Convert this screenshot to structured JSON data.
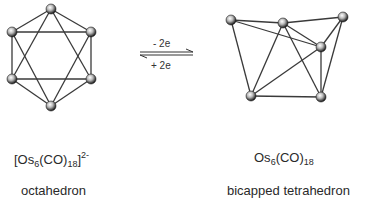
{
  "left_structure": {
    "formula_prefix": "[Os",
    "formula_sub1": "6",
    "formula_mid": "(CO)",
    "formula_sub2": "18",
    "formula_close": "]",
    "formula_charge": "2-",
    "geometry": "octahedron"
  },
  "right_structure": {
    "formula_prefix": "Os",
    "formula_sub1": "6",
    "formula_mid": "(CO)",
    "formula_sub2": "18",
    "geometry": "bicapped tetrahedron"
  },
  "equilibrium": {
    "forward_label": "- 2e",
    "reverse_label": "+ 2e"
  },
  "colors": {
    "bond": "#3a3a3a",
    "atom_dark": "#1a1a1a",
    "atom_light": "#ffffff"
  }
}
